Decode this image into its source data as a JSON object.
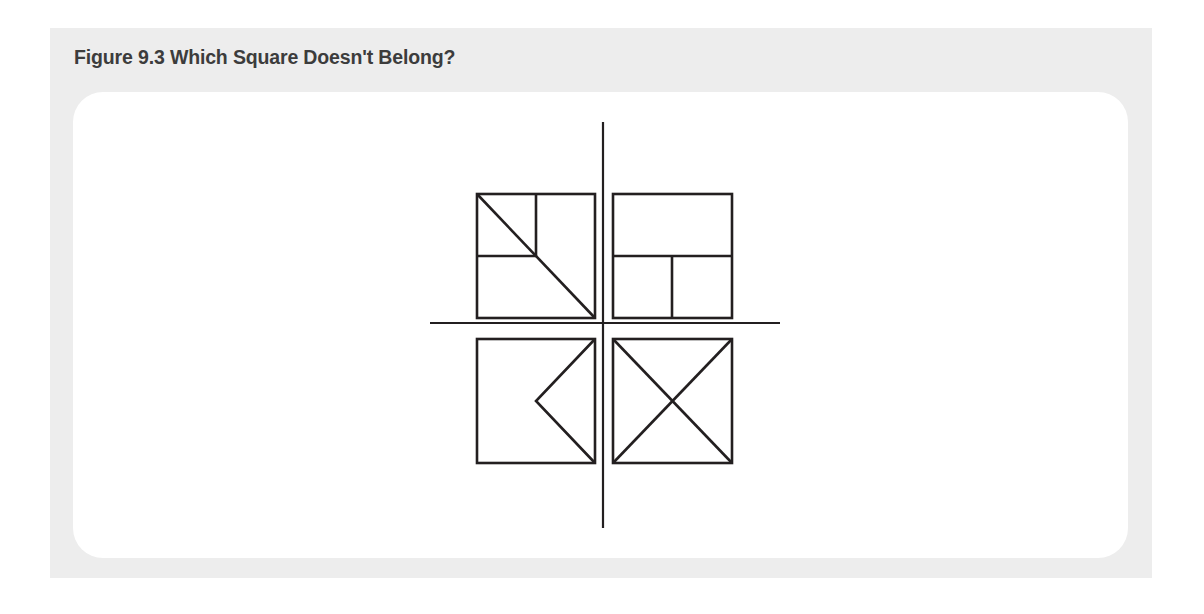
{
  "page": {
    "background_color": "#ffffff",
    "width": 1204,
    "height": 614
  },
  "panel": {
    "background_color": "#ededed"
  },
  "card": {
    "background_color": "#ffffff",
    "corner_radius": 30
  },
  "caption": {
    "text": "Figure 9.3 Which Square Doesn't Belong?",
    "color": "#3c3c3c"
  },
  "figure": {
    "title": "Which Square Doesn't Belong?",
    "type": "visual-puzzle",
    "stroke_color": "#231f20",
    "axis_stroke_color": "#231f20",
    "axes": {
      "vertical": {
        "x": 603,
        "y1": 122,
        "y2": 528,
        "stroke_width": 2.2
      },
      "horizontal": {
        "y": 323,
        "x1": 430,
        "x2": 780,
        "stroke_width": 2.2
      }
    },
    "squares": [
      {
        "id": "top-left",
        "quadrant": "top-left",
        "label": "Square 1",
        "x": 477,
        "y": 194,
        "width": 118,
        "height": 124,
        "stroke_width": 2.6,
        "internal_lines": [
          {
            "name": "diagonal-tl-br",
            "x1": 0.0,
            "y1": 0.0,
            "x2": 1.0,
            "y2": 1.0
          },
          {
            "name": "vertical-half-top",
            "x1": 0.5,
            "y1": 0.0,
            "x2": 0.5,
            "y2": 0.5
          },
          {
            "name": "horizontal-half-left",
            "x1": 0.0,
            "y1": 0.5,
            "x2": 0.5,
            "y2": 0.5
          }
        ]
      },
      {
        "id": "top-right",
        "quadrant": "top-right",
        "label": "Square 2",
        "x": 613,
        "y": 194,
        "width": 119,
        "height": 124,
        "stroke_width": 2.6,
        "internal_lines": [
          {
            "name": "horizontal-full-mid",
            "x1": 0.0,
            "y1": 0.5,
            "x2": 1.0,
            "y2": 0.5
          },
          {
            "name": "vertical-half-bottom",
            "x1": 0.5,
            "y1": 0.5,
            "x2": 0.5,
            "y2": 1.0
          }
        ]
      },
      {
        "id": "bottom-left",
        "quadrant": "bottom-left",
        "label": "Square 3",
        "x": 477,
        "y": 339,
        "width": 118,
        "height": 124,
        "stroke_width": 2.6,
        "internal_lines": [
          {
            "name": "chevron-upper-arm",
            "x1": 1.0,
            "y1": 0.0,
            "x2": 0.5,
            "y2": 0.5
          },
          {
            "name": "chevron-lower-arm",
            "x1": 0.5,
            "y1": 0.5,
            "x2": 1.0,
            "y2": 1.0
          }
        ]
      },
      {
        "id": "bottom-right",
        "quadrant": "bottom-right",
        "label": "Square 4",
        "x": 613,
        "y": 339,
        "width": 119,
        "height": 124,
        "stroke_width": 2.6,
        "internal_lines": [
          {
            "name": "diagonal-tl-br",
            "x1": 0.0,
            "y1": 0.0,
            "x2": 1.0,
            "y2": 1.0
          },
          {
            "name": "diagonal-tr-bl",
            "x1": 1.0,
            "y1": 0.0,
            "x2": 0.0,
            "y2": 1.0
          }
        ]
      }
    ]
  }
}
